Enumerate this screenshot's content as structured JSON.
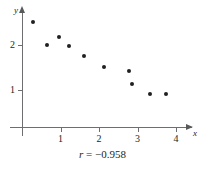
{
  "figure": {
    "background_color": "#ffffff",
    "axis_color": "#6d6e71",
    "point_color": "#231f20",
    "text_color": "#231f20"
  },
  "caption": {
    "symbol": "r",
    "equals": " = ",
    "value": "−0.958",
    "full_text": "r = −0.958"
  },
  "chart_data": {
    "type": "scatter",
    "title": "",
    "subtitle": "",
    "xlabel": "x",
    "ylabel": "y",
    "annotations": [
      "r = −0.958"
    ],
    "correlation": -0.958,
    "grid": false,
    "legend": null,
    "xlim": [
      0,
      4.4
    ],
    "ylim": [
      0,
      2.8
    ],
    "xticks": [
      1,
      2,
      3,
      4
    ],
    "xticklabels": [
      "1",
      "2",
      "3",
      "4"
    ],
    "yticks": [
      1,
      2
    ],
    "yticklabels": [
      "1",
      "2"
    ],
    "series": [
      {
        "name": "observations",
        "marker": "circle",
        "color": "#231f20",
        "points": [
          {
            "x": 0.28,
            "y": 2.51
          },
          {
            "x": 0.64,
            "y": 2.0
          },
          {
            "x": 0.95,
            "y": 2.18
          },
          {
            "x": 1.23,
            "y": 1.98
          },
          {
            "x": 1.62,
            "y": 1.76
          },
          {
            "x": 2.13,
            "y": 1.51
          },
          {
            "x": 2.77,
            "y": 1.42
          },
          {
            "x": 2.87,
            "y": 1.13
          },
          {
            "x": 3.33,
            "y": 0.91
          },
          {
            "x": 3.74,
            "y": 0.91
          }
        ]
      }
    ]
  },
  "axes": {
    "x_title": "x",
    "y_title": "y"
  },
  "pixel_mapping": {
    "x_origin_px": 22,
    "x_unit_px": 38.5,
    "y_value1_px": 90,
    "y_unit_px": 45
  }
}
